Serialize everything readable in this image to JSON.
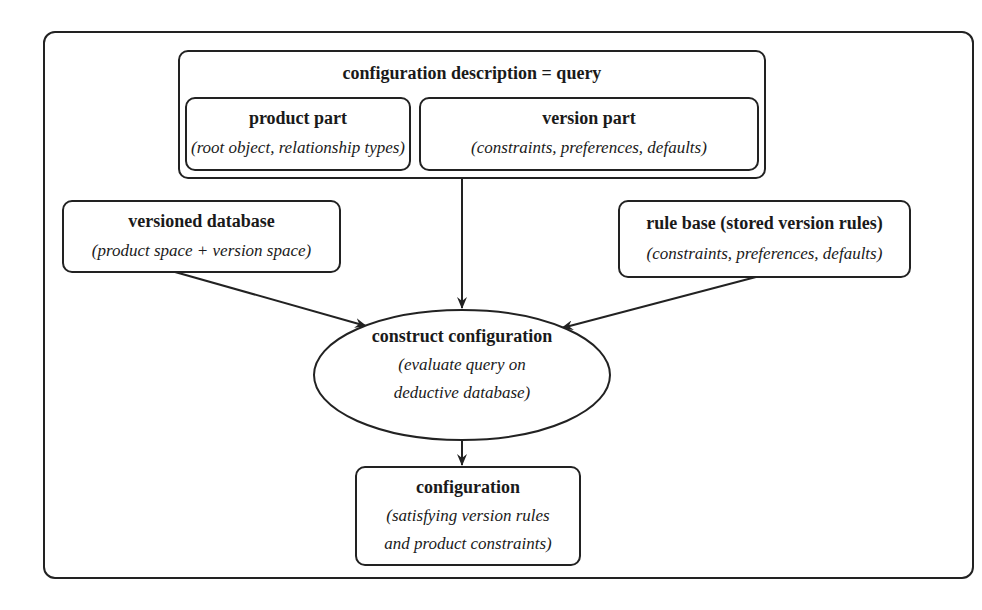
{
  "diagram": {
    "query": {
      "title": "configuration description = query",
      "product_part": {
        "title": "product part",
        "subtitle": "(root object, relationship types)"
      },
      "version_part": {
        "title": "version part",
        "subtitle": "(constraints, preferences, defaults)"
      }
    },
    "versioned_database": {
      "title": "versioned database",
      "subtitle": "(product space + version space)"
    },
    "rule_base": {
      "title": "rule base (stored version rules)",
      "subtitle": "(constraints, preferences, defaults)"
    },
    "construct": {
      "title": "construct configuration",
      "subtitle_line1": "(evaluate query on",
      "subtitle_line2": "deductive database)"
    },
    "configuration": {
      "title": "configuration",
      "subtitle_line1": "(satisfying version rules",
      "subtitle_line2": "and product constraints)"
    },
    "edges": [
      {
        "from": "query",
        "to": "construct"
      },
      {
        "from": "versioned_database",
        "to": "construct"
      },
      {
        "from": "rule_base",
        "to": "construct"
      },
      {
        "from": "construct",
        "to": "configuration"
      }
    ],
    "colors": {
      "stroke": "#222222",
      "background": "#ffffff"
    }
  }
}
